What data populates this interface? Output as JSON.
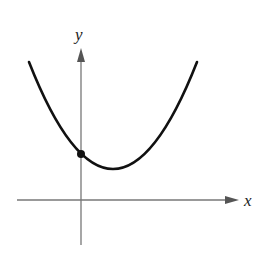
{
  "figure": {
    "type": "parabola-graph",
    "axes": {
      "x_label": "x",
      "y_label": "y",
      "axis_color": "#777777"
    },
    "curve": {
      "description": "Upward-opening parabola with vertex in first quadrant, right of the y-axis",
      "color": "#111111",
      "y_intercept_marked": true
    },
    "points": [
      {
        "name": "y-intercept",
        "shape": "filled-circle"
      }
    ]
  }
}
